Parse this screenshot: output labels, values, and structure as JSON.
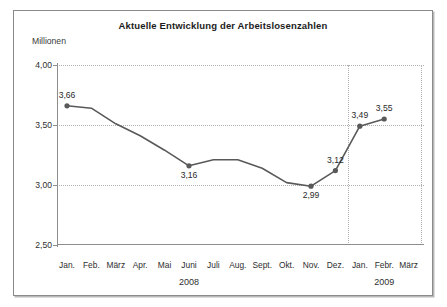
{
  "chart_data": {
    "type": "line",
    "title": "Aktuelle Entwicklung der Arbeitslosenzahlen",
    "ylabel": "Millionen",
    "xlabel": "",
    "ylim": [
      2.5,
      4.0
    ],
    "yticks": [
      "2,50",
      "3,00",
      "3,50",
      "4,00"
    ],
    "ytick_values": [
      2.5,
      3.0,
      3.5,
      4.0
    ],
    "grid": "horizontal dotted + two vertical dotted separators",
    "legend": "none",
    "categories": [
      "Jan.",
      "Feb.",
      "März",
      "Apr.",
      "Mai",
      "Juni",
      "Juli",
      "Aug.",
      "Sept.",
      "Okt.",
      "Nov.",
      "Dez.",
      "Jan.",
      "Febr.",
      "März"
    ],
    "values": [
      3.66,
      3.64,
      3.51,
      3.41,
      3.29,
      3.16,
      3.21,
      3.21,
      3.14,
      3.02,
      2.99,
      3.12,
      3.49,
      3.55,
      null
    ],
    "point_labels": [
      {
        "category": "Jan.",
        "value": 3.66,
        "text": "3,66",
        "position": "above"
      },
      {
        "category": "Juni",
        "value": 3.16,
        "text": "3,16",
        "position": "below"
      },
      {
        "category": "Nov.",
        "value": 2.99,
        "text": "2,99",
        "position": "below"
      },
      {
        "category": "Dez.",
        "value": 3.12,
        "text": "3,12",
        "position": "above"
      },
      {
        "category": "Jan.",
        "value": 3.49,
        "text": "3,49",
        "position": "above"
      },
      {
        "category": "Febr.",
        "value": 3.55,
        "text": "3,55",
        "position": "above"
      }
    ],
    "markers": [
      {
        "category": "Jan.",
        "value": 3.66
      },
      {
        "category": "Juni",
        "value": 3.16
      },
      {
        "category": "Nov.",
        "value": 2.99
      },
      {
        "category": "Dez.",
        "value": 3.12
      },
      {
        "category": "Jan.",
        "value": 3.49
      },
      {
        "category": "Febr.",
        "value": 3.55
      }
    ],
    "year_groups": [
      {
        "label": "2008",
        "center_category": "Juni"
      },
      {
        "label": "2009",
        "center_category": "Febr."
      }
    ],
    "series_color": "#595959",
    "grid_color": "#b0b0b0",
    "axis_color": "#8d8d8d",
    "frame_color": "#8a8a8a"
  }
}
